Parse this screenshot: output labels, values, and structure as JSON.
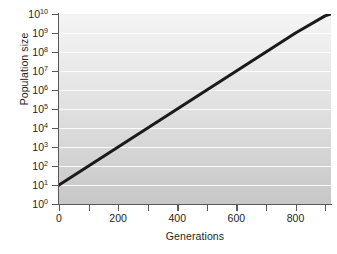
{
  "chart_data": {
    "type": "line",
    "title": "",
    "xlabel": "Generations",
    "ylabel": "Population size",
    "yscale": "log",
    "xlim": [
      0,
      920
    ],
    "ylim": [
      1,
      10000000000
    ],
    "grid": true,
    "legend": null,
    "x_ticks": [
      {
        "value": 0,
        "label": "0",
        "major": true
      },
      {
        "value": 100,
        "label": "",
        "major": false
      },
      {
        "value": 200,
        "label": "200",
        "major": true
      },
      {
        "value": 300,
        "label": "",
        "major": false
      },
      {
        "value": 400,
        "label": "400",
        "major": true
      },
      {
        "value": 500,
        "label": "",
        "major": false
      },
      {
        "value": 600,
        "label": "600",
        "major": true
      },
      {
        "value": 700,
        "label": "",
        "major": false
      },
      {
        "value": 800,
        "label": "800",
        "major": true
      },
      {
        "value": 900,
        "label": "",
        "major": false
      }
    ],
    "y_ticks": [
      {
        "exponent": 10,
        "base": "10",
        "label": "10",
        "sup": "10",
        "value": 10000000000
      },
      {
        "exponent": 9,
        "base": "10",
        "label": "10",
        "sup": "9",
        "value": 1000000000
      },
      {
        "exponent": 8,
        "base": "10",
        "label": "10",
        "sup": "8",
        "value": 100000000
      },
      {
        "exponent": 7,
        "base": "10",
        "label": "10",
        "sup": "7",
        "value": 10000000
      },
      {
        "exponent": 6,
        "base": "10",
        "label": "10",
        "sup": "6",
        "value": 1000000
      },
      {
        "exponent": 5,
        "base": "10",
        "label": "10",
        "sup": "5",
        "value": 100000
      },
      {
        "exponent": 4,
        "base": "10",
        "label": "10",
        "sup": "4",
        "value": 10000
      },
      {
        "exponent": 3,
        "base": "10",
        "label": "10",
        "sup": "3",
        "value": 1000
      },
      {
        "exponent": 2,
        "base": "10",
        "label": "10",
        "sup": "2",
        "value": 100
      },
      {
        "exponent": 1,
        "base": "10",
        "label": "10",
        "sup": "1",
        "value": 10
      },
      {
        "exponent": 0,
        "base": "10",
        "label": "10",
        "sup": "0",
        "value": 1
      }
    ],
    "series": [
      {
        "name": "Population growth",
        "color": "#1a1a1a",
        "linewidth": 3.0,
        "x": [
          0,
          100,
          200,
          300,
          400,
          500,
          600,
          700,
          800,
          900,
          920
        ],
        "y_exponent": [
          1.0,
          2.0,
          3.0,
          4.0,
          5.0,
          6.0,
          7.0,
          8.0,
          9.0,
          9.9,
          10.0
        ],
        "y": [
          10,
          100,
          1000,
          10000,
          100000,
          1000000,
          10000000,
          100000000,
          1000000000,
          7943282347,
          10000000000
        ]
      }
    ],
    "background": {
      "gradient_top": "#f4f4f4",
      "gradient_bottom": "#c7c7c7",
      "gridline_color": "#fdfdfd"
    },
    "axis_color": "#58595b",
    "text_color": "#231f20"
  },
  "caption": {
    "cut_off_text": ""
  }
}
